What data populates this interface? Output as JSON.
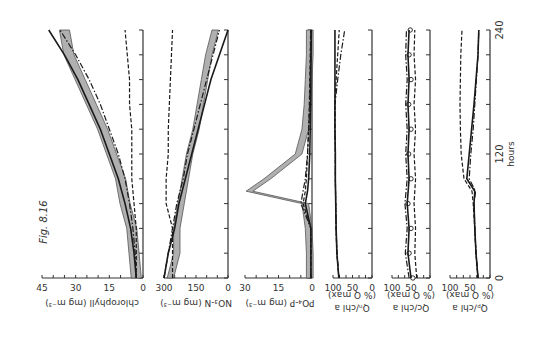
{
  "figure": {
    "caption": "Fig. 8.16",
    "rotation_deg": 180,
    "time_axis": {
      "label": "hours",
      "ticks": [
        "0",
        "120",
        "240"
      ],
      "range": [
        0,
        240
      ],
      "tick_step": 24
    }
  },
  "chart_data": [
    {
      "type": "line",
      "title": "chlorophyll",
      "xlabel": "hours",
      "ylabel": "chlorophyll (mg m^-3)",
      "ylim": [
        0,
        45
      ],
      "value_ticks": [
        "45",
        "30",
        "15",
        "0"
      ],
      "x": [
        0,
        24,
        48,
        72,
        96,
        120,
        144,
        168,
        192,
        216,
        240
      ],
      "series": [
        {
          "name": "observed (shaded band)",
          "style": "band",
          "values": [
            3,
            4,
            5,
            8,
            10,
            14,
            18,
            23,
            28,
            33,
            35
          ]
        },
        {
          "name": "model solid",
          "style": "solid",
          "values": [
            3,
            4,
            5.5,
            8,
            11,
            15,
            19,
            24,
            29,
            35,
            42
          ]
        },
        {
          "name": "model dash-dot",
          "style": "dashdot",
          "values": [
            3,
            3.5,
            4.5,
            6,
            8,
            11,
            15,
            19,
            24,
            30,
            37
          ]
        },
        {
          "name": "model dashed",
          "style": "dashed",
          "values": [
            3,
            3,
            3,
            4,
            5,
            5,
            5,
            6,
            6,
            7,
            8
          ]
        }
      ]
    },
    {
      "type": "line",
      "title": "NO3-N",
      "xlabel": "hours",
      "ylabel": "NO3-N (mg m^-3)",
      "ylim": [
        0,
        300
      ],
      "value_ticks": [
        "300",
        "150",
        "0"
      ],
      "x": [
        0,
        24,
        48,
        72,
        96,
        120,
        144,
        168,
        192,
        216,
        240
      ],
      "series": [
        {
          "name": "observed (shaded band)",
          "style": "band",
          "values": [
            270,
            240,
            240,
            220,
            200,
            180,
            150,
            130,
            110,
            90,
            60
          ]
        },
        {
          "name": "model solid",
          "style": "solid",
          "values": [
            300,
            280,
            250,
            230,
            200,
            170,
            140,
            110,
            80,
            40,
            0
          ]
        },
        {
          "name": "model dash-dot",
          "style": "dashdot",
          "values": [
            300,
            280,
            260,
            240,
            210,
            190,
            160,
            130,
            100,
            70,
            40
          ]
        },
        {
          "name": "model dashed",
          "style": "dashed",
          "values": [
            260,
            260,
            260,
            290,
            290,
            280,
            280,
            275,
            270,
            265,
            260
          ]
        }
      ]
    },
    {
      "type": "line",
      "title": "PO4-P",
      "xlabel": "hours",
      "ylabel": "PO4-P (mg m^-3)",
      "ylim": [
        0,
        30
      ],
      "value_ticks": [
        "30",
        "15",
        "0"
      ],
      "x": [
        0,
        24,
        48,
        72,
        84,
        96,
        120,
        144,
        168,
        192,
        216,
        240
      ],
      "series": [
        {
          "name": "observed (shaded band)",
          "style": "band",
          "values": [
            1,
            1,
            1.5,
            3,
            28,
            20,
            6,
            3,
            2,
            1.5,
            1,
            1
          ]
        },
        {
          "name": "model solid",
          "style": "solid",
          "values": [
            0.5,
            0.5,
            0.5,
            3,
            2,
            1.5,
            1,
            0.8,
            0.6,
            0.5,
            0.4,
            0.3
          ]
        },
        {
          "name": "model dash-dot",
          "style": "dashdot",
          "values": [
            0.5,
            0.5,
            0.5,
            5,
            4,
            3,
            2,
            1.5,
            1,
            0.8,
            0.6,
            0.5
          ]
        },
        {
          "name": "model dashed",
          "style": "dashed",
          "values": [
            0.5,
            0.5,
            0.5,
            4,
            3,
            2.5,
            2,
            1.5,
            1.2,
            1,
            0.8,
            0.6
          ]
        }
      ]
    },
    {
      "type": "line",
      "title": "QN/chl a",
      "xlabel": "hours",
      "ylabel": "QN/chl a (% Q max)",
      "ylim": [
        0,
        100
      ],
      "value_ticks": [
        "100",
        "50",
        "0"
      ],
      "x": [
        0,
        24,
        48,
        72,
        96,
        120,
        144,
        168,
        192,
        216,
        240
      ],
      "series": [
        {
          "name": "model solid",
          "style": "solid",
          "values": [
            85,
            90,
            92,
            93,
            94,
            94,
            95,
            95,
            95,
            95,
            95
          ]
        },
        {
          "name": "model dash-dot",
          "style": "dashdot",
          "values": [
            85,
            90,
            92,
            93,
            94,
            94,
            95,
            95,
            88,
            80,
            70
          ]
        },
        {
          "name": "model dashed",
          "style": "dashed",
          "values": [
            85,
            90,
            92,
            93,
            94,
            94,
            95,
            95,
            92,
            88,
            84
          ]
        }
      ]
    },
    {
      "type": "line",
      "title": "QC/chl a",
      "xlabel": "hours",
      "ylabel": "QC/chl a (% Q max)",
      "ylim": [
        0,
        100
      ],
      "value_ticks": [
        "100",
        "50",
        "0"
      ],
      "x": [
        0,
        24,
        48,
        72,
        96,
        120,
        144,
        168,
        192,
        216,
        240
      ],
      "series": [
        {
          "name": "observed (circles)",
          "style": "markers",
          "values": [
            45,
            55,
            50,
            58,
            50,
            56,
            50,
            56,
            50,
            55,
            52
          ]
        },
        {
          "name": "model solid",
          "style": "solid",
          "values": [
            50,
            58,
            55,
            60,
            55,
            58,
            55,
            58,
            55,
            58,
            55
          ]
        },
        {
          "name": "model dash-dot",
          "style": "dashdot",
          "values": [
            55,
            65,
            60,
            66,
            60,
            64,
            60,
            64,
            60,
            64,
            62
          ]
        },
        {
          "name": "model dashed",
          "style": "dashed",
          "values": [
            35,
            40,
            38,
            42,
            38,
            42,
            38,
            42,
            38,
            42,
            40
          ]
        }
      ]
    },
    {
      "type": "line",
      "title": "QP/chl a",
      "xlabel": "hours",
      "ylabel": "QP/chl a (% Q max)",
      "ylim": [
        0,
        100
      ],
      "value_ticks": [
        "100",
        "50",
        "0"
      ],
      "x": [
        0,
        24,
        48,
        72,
        84,
        96,
        120,
        144,
        168,
        192,
        216,
        240
      ],
      "series": [
        {
          "name": "model solid",
          "style": "solid",
          "values": [
            30,
            35,
            38,
            40,
            38,
            58,
            52,
            46,
            40,
            35,
            30,
            28
          ]
        },
        {
          "name": "model dash-dot",
          "style": "dashdot",
          "values": [
            30,
            35,
            38,
            40,
            36,
            52,
            48,
            42,
            38,
            34,
            30,
            28
          ]
        },
        {
          "name": "model dashed",
          "style": "dashed",
          "values": [
            30,
            35,
            38,
            42,
            45,
            65,
            72,
            74,
            75,
            74,
            73,
            70
          ]
        }
      ]
    }
  ],
  "labels": {
    "panel_0": "chlorophyll (mg m⁻³)",
    "panel_1": "NO₃-N (mg m⁻³)",
    "panel_2": "PO₄-P (mg m⁻³)",
    "panel_3a": "Qₙ/chl a",
    "panel_3b": "(% Q max)",
    "panel_4a": "Qᴄ/chl a",
    "panel_4b": "(% Q max)",
    "panel_5a": "Qₚ/chl a",
    "panel_5b": "(% Q max)"
  },
  "layout": {
    "panels": [
      {
        "left": 42,
        "right": 143
      },
      {
        "left": 164,
        "right": 228
      },
      {
        "left": 245,
        "right": 312
      },
      {
        "left": 333,
        "right": 372
      },
      {
        "left": 392,
        "right": 430
      },
      {
        "left": 450,
        "right": 490
      }
    ],
    "t_top": 30,
    "t_bottom": 278,
    "colors": {
      "line": "#1a1a1a",
      "band": "#9a9a9a",
      "axis": "#333333"
    }
  }
}
